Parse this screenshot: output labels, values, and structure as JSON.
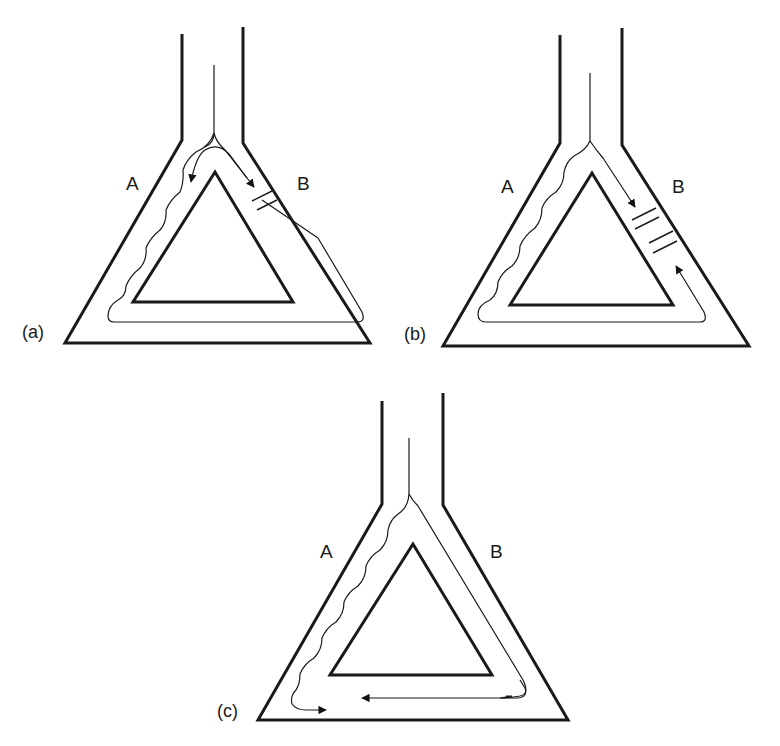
{
  "figure": {
    "panels": [
      {
        "id": "a",
        "tag": "(a)",
        "branch_left_label": "A",
        "branch_right_label": "B",
        "description": "Flow enters apex, splits; wavy path down branch A around the loop, straight path down branch B to a double-bar block; arrows show flow returning toward apex on left and down on right"
      },
      {
        "id": "b",
        "tag": "(b)",
        "branch_left_label": "A",
        "branch_right_label": "B",
        "description": "Flow down branch B meets a block (two double bars); wavy path down A travels around the bottom and back up B to meet the block from below"
      },
      {
        "id": "c",
        "tag": "(c)",
        "branch_left_label": "A",
        "branch_right_label": "B",
        "description": "Wavy path down A and straight path down B travel along the bottom limb and meet head-on, arrows pointing toward each other"
      }
    ],
    "colors": {
      "line": "#1a1a1a",
      "background": "#ffffff"
    }
  }
}
